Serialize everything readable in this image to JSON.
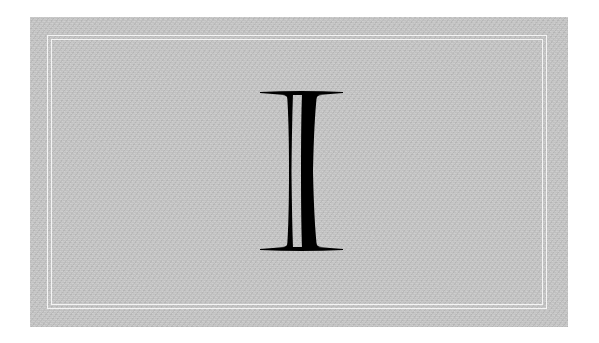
{
  "card": {
    "glyph": "I",
    "style": "double-struck serif capital letter",
    "background_color": "#c6c6c6",
    "frame_color": "#f4f4f4",
    "glyph_color": "#000000"
  }
}
